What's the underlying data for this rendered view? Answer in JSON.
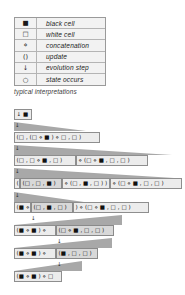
{
  "legend": {
    "rows": [
      {
        "symbol": "■",
        "meaning": "black cell"
      },
      {
        "symbol": "□",
        "meaning": "white cell"
      },
      {
        "symbol": "⋄",
        "meaning": "concatenation"
      },
      {
        "symbol": "()",
        "meaning": "update"
      },
      {
        "symbol": "↓",
        "meaning": "evolution step"
      },
      {
        "symbol": "○",
        "meaning": "state occurs"
      }
    ],
    "caption": "typical interpretations"
  },
  "tree": {
    "step_symbol": "↓",
    "nodes": [
      {
        "id": "n1",
        "text": "↓ ■"
      },
      {
        "id": "n2",
        "text": "(□ , (□ ⋄ ■ ) ⋄ □ , □ )"
      },
      {
        "id": "n3a",
        "text": "(□ , □ ⋄ ■ , □ )"
      },
      {
        "id": "n3b",
        "text": "⋄ (□ ⋄ ■ , □ , □ )"
      },
      {
        "id": "n4a",
        "text": "("
      },
      {
        "id": "n4b",
        "text": "(□ , □ , ■ )"
      },
      {
        "id": "n4c",
        "text": "⋄ (□ , ■ , □ ) )"
      },
      {
        "id": "n4d",
        "text": "⋄ (□ ⋄ ■ , □ , □ )"
      },
      {
        "id": "n5a",
        "text": "(■ ⋄"
      },
      {
        "id": "n5b",
        "text": "(□ , ■ , □ )"
      },
      {
        "id": "n5c",
        "text": ") ⋄ (□ ⋄ ■ , □ , □ )"
      },
      {
        "id": "n6a",
        "text": "(■ ⋄ ■ ) ⋄"
      },
      {
        "id": "n6b",
        "text": "(□ ⋄ ■ , □ , □ )"
      },
      {
        "id": "n7a",
        "text": "(■ ⋄ ■ ) ⋄"
      },
      {
        "id": "n7b",
        "text": "(■ , □ , □ )"
      },
      {
        "id": "n8",
        "text": "(■ ⋄ ■ ) ⋄ □"
      }
    ]
  },
  "colors": {
    "node_fill": "#ececec",
    "inner_fill": "#d8d8d8",
    "connector": "#a8a8a8",
    "border": "#8e8e8e"
  }
}
